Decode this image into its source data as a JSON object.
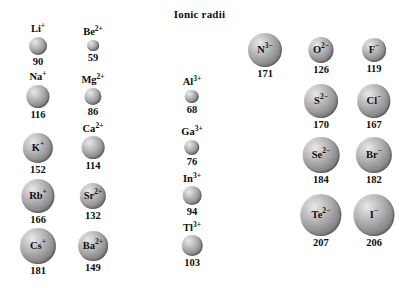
{
  "title": "Ionic radii",
  "units_note": "",
  "chart_data": {
    "type": "diagram",
    "title": "Ionic radii",
    "value_unit": "pm",
    "columns": [
      {
        "name": "group-1-cations",
        "ions": [
          {
            "symbol": "Li",
            "charge": "+",
            "label": "Li+",
            "value": 90,
            "label_inside": false
          },
          {
            "symbol": "Na",
            "charge": "+",
            "label": "Na+",
            "value": 116,
            "label_inside": false
          },
          {
            "symbol": "K",
            "charge": "+",
            "label": "K+",
            "value": 152,
            "label_inside": true
          },
          {
            "symbol": "Rb",
            "charge": "+",
            "label": "Rb+",
            "value": 166,
            "label_inside": true
          },
          {
            "symbol": "Cs",
            "charge": "+",
            "label": "Cs+",
            "value": 181,
            "label_inside": true
          }
        ]
      },
      {
        "name": "group-2-cations",
        "ions": [
          {
            "symbol": "Be",
            "charge": "2+",
            "label": "Be2+",
            "value": 59,
            "label_inside": false
          },
          {
            "symbol": "Mg",
            "charge": "2+",
            "label": "Mg2+",
            "value": 86,
            "label_inside": false
          },
          {
            "symbol": "Ca",
            "charge": "2+",
            "label": "Ca2+",
            "value": 114,
            "label_inside": false
          },
          {
            "symbol": "Sr",
            "charge": "2+",
            "label": "Sr2+",
            "value": 132,
            "label_inside": true
          },
          {
            "symbol": "Ba",
            "charge": "2+",
            "label": "Ba2+",
            "value": 149,
            "label_inside": true
          }
        ]
      },
      {
        "name": "group-13-cations",
        "ions": [
          {
            "symbol": "Al",
            "charge": "3+",
            "label": "Al3+",
            "value": 68,
            "label_inside": false
          },
          {
            "symbol": "Ga",
            "charge": "3+",
            "label": "Ga3+",
            "value": 76,
            "label_inside": false
          },
          {
            "symbol": "In",
            "charge": "3+",
            "label": "In3+",
            "value": 94,
            "label_inside": false
          },
          {
            "symbol": "Tl",
            "charge": "3+",
            "label": "Tl3+",
            "value": 103,
            "label_inside": false
          }
        ]
      },
      {
        "name": "group-15-16-anions-left",
        "ions": [
          {
            "symbol": "N",
            "charge": "3−",
            "label": "N3-",
            "value": 171,
            "label_inside": true
          },
          {
            "symbol": "O",
            "charge": "2−",
            "label": "O2-",
            "value": 126,
            "label_inside": true
          },
          {
            "symbol": "S",
            "charge": "2−",
            "label": "S2-",
            "value": 170,
            "label_inside": true
          },
          {
            "symbol": "Se",
            "charge": "2−",
            "label": "Se2-",
            "value": 184,
            "label_inside": true
          },
          {
            "symbol": "Te",
            "charge": "2−",
            "label": "Te2-",
            "value": 207,
            "label_inside": true
          }
        ]
      },
      {
        "name": "group-17-anions",
        "ions": [
          {
            "symbol": "F",
            "charge": "−",
            "label": "F-",
            "value": 119,
            "label_inside": true
          },
          {
            "symbol": "Cl",
            "charge": "−",
            "label": "Cl-",
            "value": 167,
            "label_inside": true
          },
          {
            "symbol": "Br",
            "charge": "−",
            "label": "Br-",
            "value": 182,
            "label_inside": true
          },
          {
            "symbol": "I",
            "charge": "−",
            "label": "I-",
            "value": 206,
            "label_inside": true
          }
        ]
      }
    ],
    "layout": {
      "px_per_pm": 0.2,
      "min_diameter_px": 10,
      "positions": [
        {
          "key": "Li+",
          "cx": 38,
          "cy": 46
        },
        {
          "key": "Na+",
          "cx": 38,
          "cy": 97
        },
        {
          "key": "K+",
          "cx": 38,
          "cy": 148
        },
        {
          "key": "Rb+",
          "cx": 38,
          "cy": 196
        },
        {
          "key": "Cs+",
          "cx": 38,
          "cy": 246
        },
        {
          "key": "Be2+",
          "cx": 93,
          "cy": 46
        },
        {
          "key": "Mg2+",
          "cx": 93,
          "cy": 97
        },
        {
          "key": "Ca2+",
          "cx": 93,
          "cy": 148
        },
        {
          "key": "Sr2+",
          "cx": 93,
          "cy": 196
        },
        {
          "key": "Ba2+",
          "cx": 93,
          "cy": 246
        },
        {
          "key": "Al3+",
          "cx": 192,
          "cy": 97
        },
        {
          "key": "Ga3+",
          "cx": 192,
          "cy": 148
        },
        {
          "key": "In3+",
          "cx": 192,
          "cy": 196
        },
        {
          "key": "Tl3+",
          "cx": 192,
          "cy": 246
        },
        {
          "key": "N3-",
          "cx": 265,
          "cy": 50
        },
        {
          "key": "O2-",
          "cx": 321,
          "cy": 50
        },
        {
          "key": "F-",
          "cx": 374,
          "cy": 50
        },
        {
          "key": "S2-",
          "cx": 321,
          "cy": 101
        },
        {
          "key": "Cl-",
          "cx": 374,
          "cy": 101
        },
        {
          "key": "Se2-",
          "cx": 321,
          "cy": 155
        },
        {
          "key": "Br-",
          "cx": 374,
          "cy": 155
        },
        {
          "key": "Te2-",
          "cx": 321,
          "cy": 215
        },
        {
          "key": "I-",
          "cx": 374,
          "cy": 215
        }
      ]
    }
  }
}
